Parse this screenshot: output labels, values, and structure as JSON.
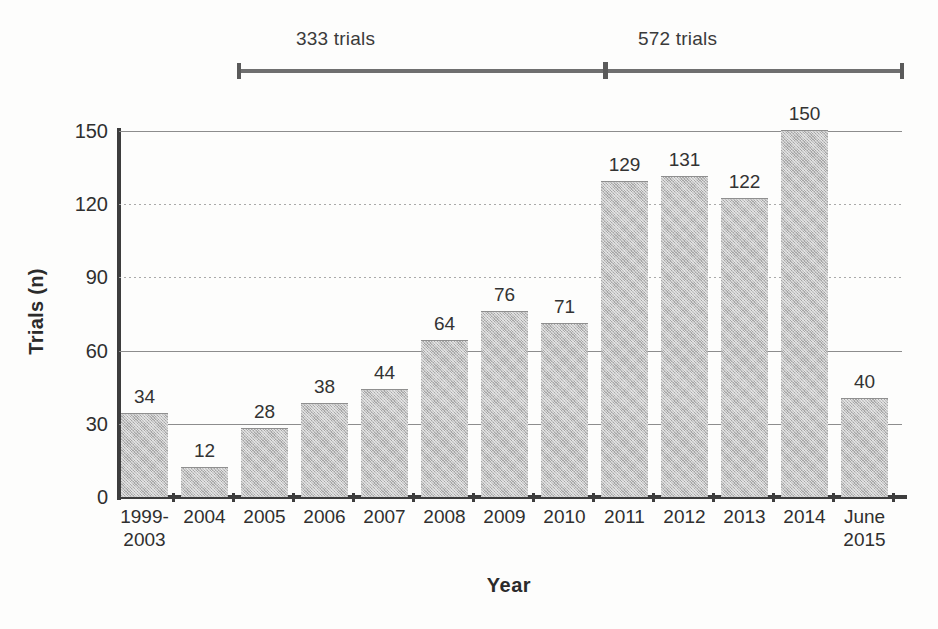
{
  "annotation": {
    "left_label": "333 trials",
    "right_label": "572 trials"
  },
  "chart_data": {
    "type": "bar",
    "title": "",
    "xlabel": "Year",
    "ylabel": "Trials (n)",
    "categories": [
      "1999-\n2003",
      "2004",
      "2005",
      "2006",
      "2007",
      "2008",
      "2009",
      "2010",
      "2011",
      "2012",
      "2013",
      "2014",
      "June\n2015"
    ],
    "values": [
      34,
      12,
      28,
      38,
      44,
      64,
      76,
      71,
      129,
      131,
      122,
      150,
      40
    ],
    "value_labels": [
      "34",
      "12",
      "28",
      "38",
      "44",
      "64",
      "76",
      "71",
      "129",
      "131",
      "122",
      "150",
      "40"
    ],
    "ylim": [
      0,
      150
    ],
    "yticks": [
      0,
      30,
      60,
      90,
      120,
      150
    ],
    "ytick_labels": [
      "0",
      "30",
      "60",
      "90",
      "120",
      "150"
    ],
    "grid": true,
    "legend": "none",
    "bar_color": "#a6a6a6",
    "axis_color": "#3d3d3d",
    "annotations": [
      {
        "text": "333 trials",
        "covers": "1999-2003 through 2010",
        "total": 333
      },
      {
        "text": "572 trials",
        "covers": "2011 through June 2015",
        "total": 572
      }
    ]
  }
}
